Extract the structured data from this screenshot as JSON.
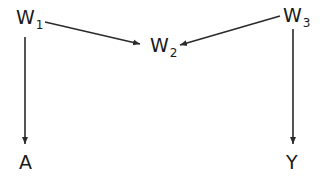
{
  "diagram": {
    "type": "directed-acyclic-graph",
    "nodes": [
      {
        "id": "W1",
        "label": "W",
        "subscript": "1",
        "x": 16,
        "y": 8
      },
      {
        "id": "W2",
        "label": "W",
        "subscript": "2",
        "x": 150,
        "y": 36
      },
      {
        "id": "W3",
        "label": "W",
        "subscript": "3",
        "x": 283,
        "y": 6
      },
      {
        "id": "A",
        "label": "A",
        "subscript": "",
        "x": 19,
        "y": 153
      },
      {
        "id": "Y",
        "label": "Y",
        "subscript": "",
        "x": 286,
        "y": 153
      }
    ],
    "edges": [
      {
        "from": "W1",
        "to": "W2"
      },
      {
        "from": "W3",
        "to": "W2"
      },
      {
        "from": "W1",
        "to": "A"
      },
      {
        "from": "W3",
        "to": "Y"
      }
    ],
    "colors": {
      "line": "#2a2a2a",
      "text": "#1a1a1a",
      "background": "#ffffff"
    }
  }
}
